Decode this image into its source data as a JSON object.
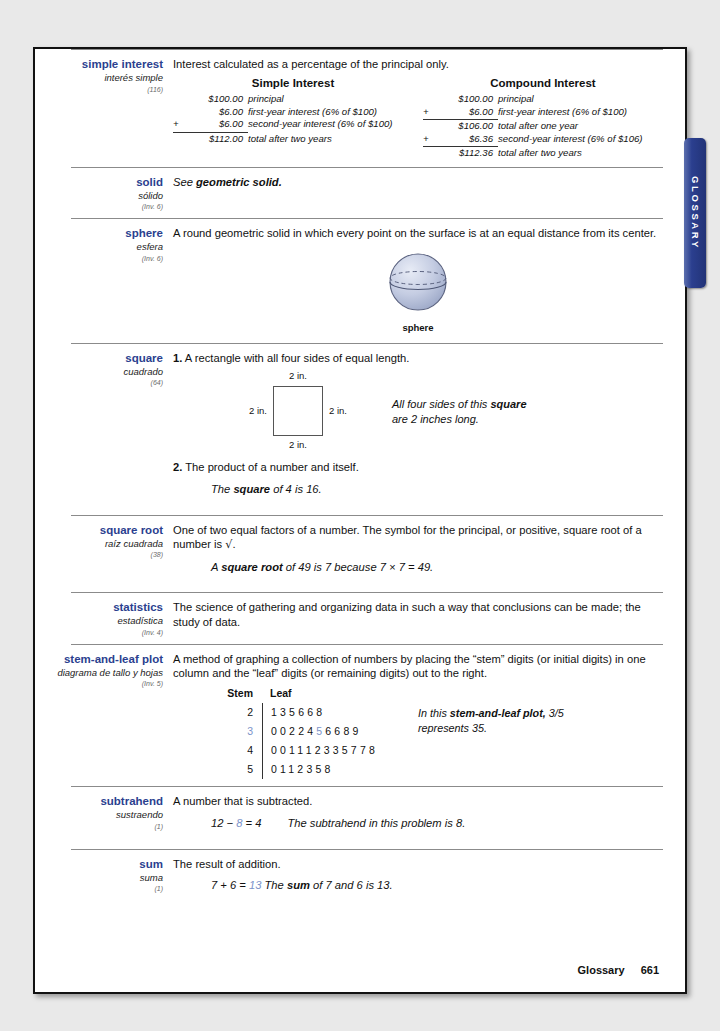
{
  "page": {
    "footer_label": "Glossary",
    "footer_page": "661",
    "side_tab": "GLOSSARY",
    "accent_blue": "#2b3f8f",
    "highlight_blue": "#7b93c9"
  },
  "entries": [
    {
      "term": "simple interest",
      "term_es": "interés simple",
      "ref": "(116)",
      "definition": "Interest calculated as a percentage of the principal only.",
      "tables": [
        {
          "title": "Simple Interest",
          "rows": [
            {
              "op": "",
              "amount": "$100.00",
              "label": "principal",
              "underline": false
            },
            {
              "op": "",
              "amount": "$6.00",
              "label": "first-year interest (6% of $100)",
              "underline": false
            },
            {
              "op": "+",
              "amount": "$6.00",
              "label": "second-year interest (6% of $100)",
              "underline": true
            },
            {
              "op": "",
              "amount": "$112.00",
              "label": "total after two years",
              "underline": false
            }
          ]
        },
        {
          "title": "Compound Interest",
          "rows": [
            {
              "op": "",
              "amount": "$100.00",
              "label": "principal",
              "underline": false
            },
            {
              "op": "+",
              "amount": "$6.00",
              "label": "first-year interest (6% of $100)",
              "underline": true
            },
            {
              "op": "",
              "amount": "$106.00",
              "label": "total after one year",
              "underline": false
            },
            {
              "op": "+",
              "amount": "$6.36",
              "label": "second-year interest (6% of $106)",
              "underline": true
            },
            {
              "op": "",
              "amount": "$112.36",
              "label": "total after two years",
              "underline": false
            }
          ]
        }
      ]
    },
    {
      "term": "solid",
      "term_es": "sólido",
      "ref": "(Inv. 6)",
      "definition_pre": "See ",
      "definition_bold": "geometric solid."
    },
    {
      "term": "sphere",
      "term_es": "esfera",
      "ref": "(Inv. 6)",
      "definition": "A round geometric solid in which every point on the  surface is at an equal distance from its center.",
      "figure_caption": "sphere"
    },
    {
      "term": "square",
      "term_es": "cuadrado",
      "ref": "(64)",
      "sense1_num": "1.",
      "sense1": "A rectangle with all four sides of equal length.",
      "diagram": {
        "top_label": "2 in.",
        "left_label": "2 in.",
        "right_label": "2 in.",
        "bottom_label": "2 in."
      },
      "note_line1_pre": "All four sides of this ",
      "note_line1_bold": "square",
      "note_line2": "are 2 inches long.",
      "sense2_num": "2.",
      "sense2": "The product of a number and itself.",
      "example_pre": "The ",
      "example_bold": "square",
      "example_post": " of 4 is 16."
    },
    {
      "term": "square root",
      "term_es": "raíz cuadrada",
      "ref": "(38)",
      "definition_part1": "One of two equal factors of a number. The symbol for the principal, or positive, square root of a number is ",
      "radical": "√",
      "definition_part2": ".",
      "example_pre": "A ",
      "example_bold": "square root",
      "example_post": " of 49 is 7 because 7 × 7 = 49."
    },
    {
      "term": "statistics",
      "term_es": "estadística",
      "ref": "(Inv. 4)",
      "definition": "The science of gathering and organizing data in such a way that conclusions can be made; the study of data."
    },
    {
      "term": "stem-and-leaf plot",
      "term_es": "diagrama de tallo y hojas",
      "ref": "(Inv. 5)",
      "definition": "A method of graphing a collection of numbers by placing the “stem” digits (or initial digits) in one column and the “leaf” digits (or remaining digits) out to the right.",
      "plot": {
        "stem_header": "Stem",
        "leaf_header": "Leaf",
        "rows": [
          {
            "stem": "2",
            "leaves": [
              "1",
              "3",
              "5",
              "6",
              "6",
              "8"
            ],
            "stem_hl": false,
            "hl_index": -1
          },
          {
            "stem": "3",
            "leaves": [
              "0",
              "0",
              "2",
              "2",
              "4",
              "5",
              "6",
              "6",
              "8",
              "9"
            ],
            "stem_hl": true,
            "hl_index": 5
          },
          {
            "stem": "4",
            "leaves": [
              "0",
              "0",
              "1",
              "1",
              "1",
              "2",
              "3",
              "3",
              "5",
              "7",
              "7",
              "8"
            ],
            "stem_hl": false,
            "hl_index": -1
          },
          {
            "stem": "5",
            "leaves": [
              "0",
              "1",
              "1",
              "2",
              "3",
              "5",
              "8"
            ],
            "stem_hl": false,
            "hl_index": -1
          }
        ]
      },
      "note_pre": "In this ",
      "note_bold": "stem-and-leaf plot,",
      "note_value": " 3/5",
      "note_post": " represents 35."
    },
    {
      "term": "subtrahend",
      "term_es": "sustraendo",
      "ref": "(1)",
      "definition": "A number that is subtracted.",
      "equation_a": "12 − ",
      "equation_hl": "8",
      "equation_b": " = 4",
      "example": "The subtrahend in this problem is 8."
    },
    {
      "term": "sum",
      "term_es": "suma",
      "ref": "(1)",
      "definition": "The result of addition.",
      "equation_a": "7 + 6 = ",
      "equation_hl": "13",
      "equation_b": "",
      "example_pre": "The ",
      "example_bold": "sum",
      "example_post": " of 7 and 6 is 13."
    }
  ]
}
